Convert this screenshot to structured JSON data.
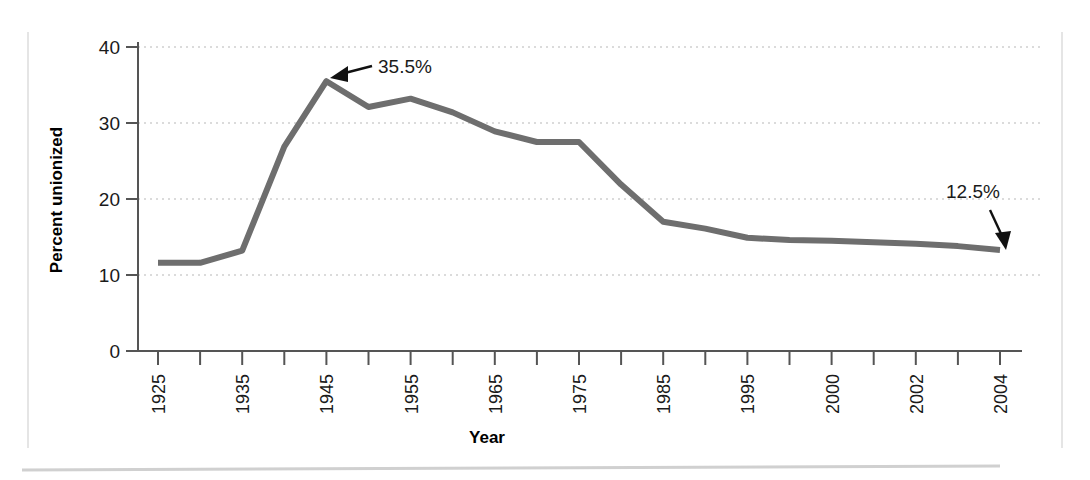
{
  "page": {
    "background_color": "#ffffff",
    "line_color": "#6e6e6e",
    "grid_color": "#cfcfcf",
    "axis_color": "#555555",
    "text_color": "#1a1a1a",
    "border_color": "#d8d8d8",
    "footer_rule_color": "#d0d0d0"
  },
  "chart_data": {
    "type": "line",
    "title": "",
    "xlabel": "Year",
    "ylabel": "Percent unionized",
    "ylim": [
      0,
      40
    ],
    "yticks": [
      0,
      10,
      20,
      30,
      40
    ],
    "ytick_labels": [
      "0",
      "10",
      "20",
      "30",
      "40"
    ],
    "grid": "horizontal-dotted",
    "legend": "none",
    "axis_type": "categorical",
    "categories": [
      "1925",
      "1930",
      "1935",
      "1940",
      "1945",
      "1950",
      "1955",
      "1960",
      "1965",
      "1970",
      "1975",
      "1980",
      "1985",
      "1990",
      "1995",
      "1998",
      "2000",
      "2001",
      "2002",
      "2003",
      "2004"
    ],
    "xtick_labels_shown": [
      "1925",
      "",
      "1935",
      "",
      "1945",
      "",
      "1955",
      "",
      "1965",
      "",
      "1975",
      "",
      "1985",
      "",
      "1995",
      "",
      "2000",
      "",
      "2002",
      "",
      "2004"
    ],
    "series": [
      {
        "name": "Percent unionized",
        "values": [
          11.6,
          11.6,
          13.2,
          26.9,
          35.5,
          32.1,
          33.2,
          31.4,
          28.9,
          27.5,
          27.5,
          21.9,
          17.0,
          16.1,
          14.9,
          14.6,
          14.5,
          14.3,
          14.1,
          13.8,
          13.3
        ]
      }
    ],
    "annotations": [
      {
        "label": "35.5%",
        "target_category": "1945",
        "target_value": 35.5,
        "arrow": "down-left"
      },
      {
        "label": "12.5%",
        "target_category": "2004",
        "target_value": 13.3,
        "arrow": "down"
      }
    ]
  }
}
